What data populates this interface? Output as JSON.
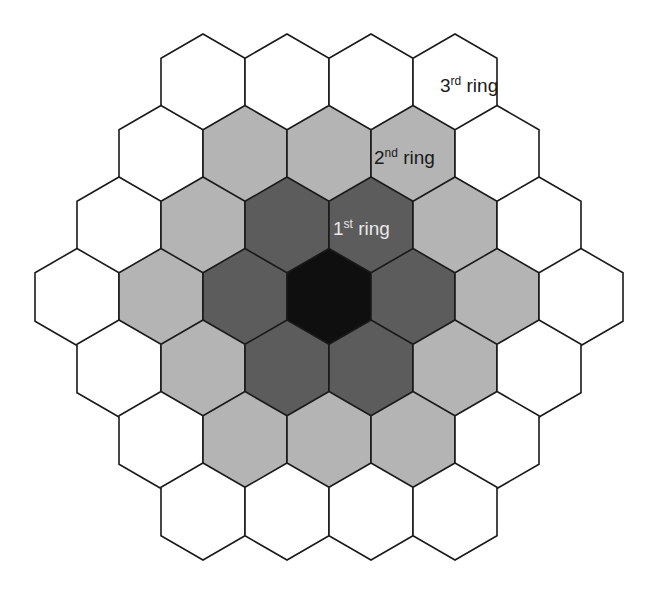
{
  "diagram": {
    "center": {
      "x": 329,
      "y": 297
    },
    "hex_width": 84,
    "hex_radius": 48.5,
    "row_spacing": 71.5,
    "colors": {
      "center": "#0f0f0f",
      "ring1": "#5c5c5c",
      "ring2": "#b4b4b4",
      "ring3": "#ffffff",
      "stroke": "#1a1a1a"
    },
    "labels": [
      {
        "id": "ring3",
        "number": "3",
        "suffix": "rd",
        "word": " ring",
        "color": "#1a1a1a",
        "x": 440,
        "y": 92
      },
      {
        "id": "ring2",
        "number": "2",
        "suffix": "nd",
        "word": " ring",
        "color": "#1a1a1a",
        "x": 374,
        "y": 164
      },
      {
        "id": "ring1",
        "number": "1",
        "suffix": "st",
        "word": " ring",
        "color": "#e8e8e8",
        "x": 333,
        "y": 235
      }
    ]
  }
}
